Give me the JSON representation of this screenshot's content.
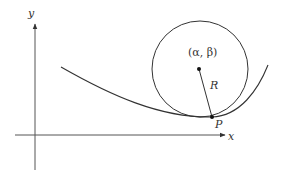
{
  "diagram": {
    "axes": {
      "x_label": "x",
      "y_label": "y"
    },
    "circle": {
      "center_label": "(α, β)",
      "radius_label": "R"
    },
    "point": {
      "label": "P"
    },
    "colors": {
      "stroke": "#333333",
      "background": "#ffffff"
    }
  }
}
